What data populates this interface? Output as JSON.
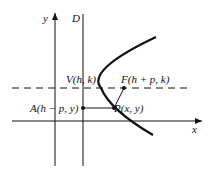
{
  "diagram": {
    "axes": {
      "x_label": "x",
      "y_label": "y"
    },
    "directrix_label": "D",
    "points": {
      "vertex": "V(h, k)",
      "focus": "F(h + p, k)",
      "point": "P(x, y)",
      "directrix_point": "A(h − p, y)"
    },
    "colors": {
      "ink": "#111111",
      "background": "#ffffff"
    }
  }
}
